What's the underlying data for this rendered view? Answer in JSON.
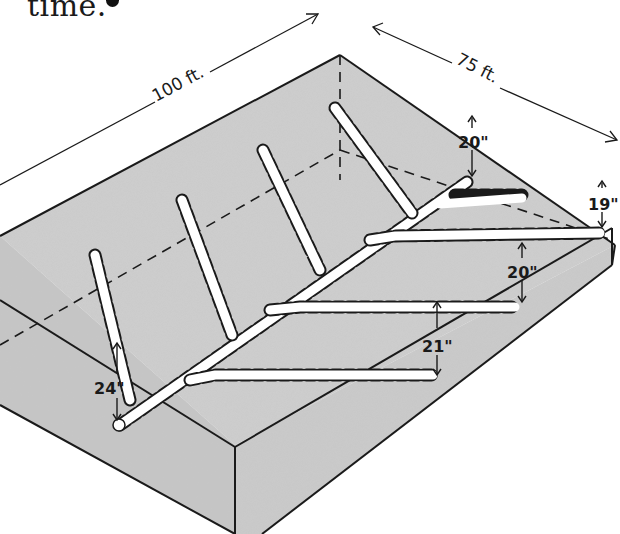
{
  "caption": {
    "text": "time.",
    "bullet": "•"
  },
  "figure": {
    "dimensions": {
      "length_label": "100 ft.",
      "width_label": "75 ft."
    },
    "depth_labels": {
      "upper_main": "20\"",
      "right_lateral_1": "19\"",
      "right_lateral_2": "20\"",
      "right_lateral_3": "21\"",
      "outlet": "24\""
    },
    "colors": {
      "soil_fill": "#c9c9c9",
      "tile": "#ffffff",
      "line": "#1a1a1a",
      "background": "#ffffff"
    }
  }
}
